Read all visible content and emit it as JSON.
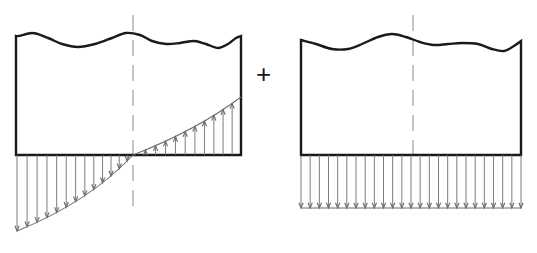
{
  "figure": {
    "type": "engineering-diagram",
    "background_color": "#ffffff",
    "outline_color": "#1a1a1a",
    "load_line_color": "#6e6e6e",
    "centerline_color": "#8a8a8a",
    "operator": {
      "label": "+",
      "x": 265,
      "y": 75,
      "font_size": 26
    },
    "panels": [
      {
        "name": "left-panel",
        "id": "triangular-pressure-panel",
        "body": {
          "left": 16,
          "right": 241,
          "top": 36,
          "bottom": 155,
          "stroke_width": 2.4
        },
        "top_edge": {
          "type": "break-line-wavy",
          "points": "16,38 32,33 48,38 62,44 78,47 95,44 112,38 126,33 140,35 152,41 166,44 180,43 194,41 206,44 218,48 228,44 236,38 241,36"
        },
        "centerline": {
          "x": 133,
          "y_top": 15,
          "y_bottom": 207,
          "dash": "16 9"
        },
        "pressure_diagram": {
          "type": "linear-varying",
          "baseline_y": 155,
          "zero_crossing_x": 133,
          "start": {
            "x": 17,
            "y": 231
          },
          "end": {
            "x": 241,
            "y": 97
          },
          "curvature": "slight-concave-up",
          "arrow_count": 24,
          "arrow_direction_left": "down",
          "arrow_direction_right": "up",
          "stroke_width": 0.9
        }
      },
      {
        "name": "right-panel",
        "id": "uniform-pressure-panel",
        "body": {
          "left": 301,
          "right": 521,
          "top": 40,
          "bottom": 155,
          "stroke_width": 2.4
        },
        "top_edge": {
          "type": "break-line-wavy",
          "points": "301,40 316,44 332,49 348,49 362,44 378,37 392,34 406,37 420,42 434,45 448,44 462,43 478,44 492,49 504,51 514,46 521,41"
        },
        "centerline": {
          "x": 413,
          "y_top": 15,
          "y_bottom": 157,
          "dash": "16 9"
        },
        "pressure_diagram": {
          "type": "uniform",
          "baseline_y": 155,
          "bottom_y": 208,
          "left_x": 301,
          "right_x": 521,
          "arrow_count": 24,
          "arrow_direction": "down",
          "has_closing_line": true,
          "stroke_width": 0.9
        }
      }
    ]
  }
}
